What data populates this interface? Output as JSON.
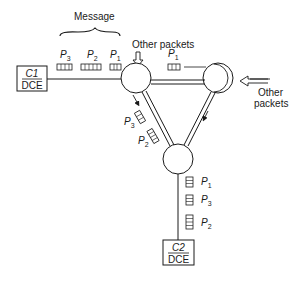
{
  "diagram": {
    "message_label": "Message",
    "other_packets_top": "Other packets",
    "other_packets_right_line1": "Other",
    "other_packets_right_line2": "packets",
    "source": {
      "top": "C1",
      "bottom": "DCE"
    },
    "destination": {
      "top": "C2",
      "bottom": "DCE"
    },
    "message_packets": [
      {
        "name": "P",
        "sub": "3"
      },
      {
        "name": "P",
        "sub": "2"
      },
      {
        "name": "P",
        "sub": "1"
      }
    ],
    "top_link_packet": {
      "name": "P",
      "sub": "1"
    },
    "diagonal_packets": [
      {
        "name": "P",
        "sub": "3"
      },
      {
        "name": "P",
        "sub": "2"
      }
    ],
    "output_packets": [
      {
        "name": "P",
        "sub": "1"
      },
      {
        "name": "P",
        "sub": "3"
      },
      {
        "name": "P",
        "sub": "2"
      }
    ]
  }
}
